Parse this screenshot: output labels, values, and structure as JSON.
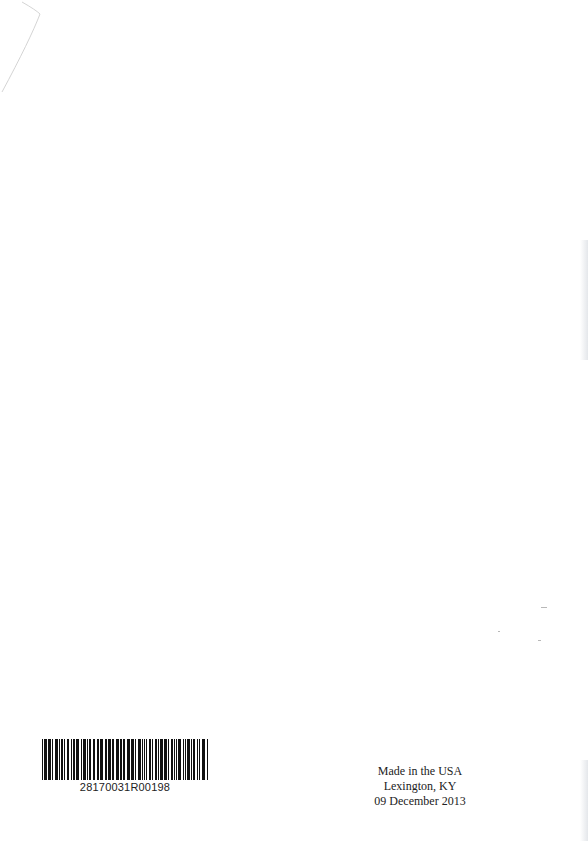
{
  "page": {
    "background": "#ffffff"
  },
  "barcode": {
    "number": "28170031R00198",
    "bar_color": "#111111"
  },
  "imprint": {
    "line1": "Made in the USA",
    "line2": "Lexington, KY",
    "line3": "09 December 2013"
  }
}
